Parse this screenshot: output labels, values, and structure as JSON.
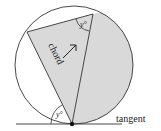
{
  "diagram": {
    "labels": {
      "chord": "chord",
      "tangent": "tangent",
      "angle_top": "y°",
      "angle_bottom": "y°"
    },
    "colors": {
      "shade": "#d9d9d9",
      "stroke": "#333333",
      "background": "#ffffff"
    }
  }
}
